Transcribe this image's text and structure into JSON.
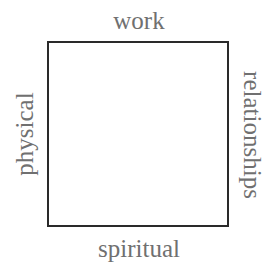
{
  "diagram": {
    "type": "square-quadrant",
    "labels": {
      "top": "work",
      "right": "relationships",
      "bottom": "spiritual",
      "left": "physical"
    },
    "colors": {
      "border": "#2a2a2a",
      "text": "#707070",
      "background": "#ffffff"
    }
  }
}
